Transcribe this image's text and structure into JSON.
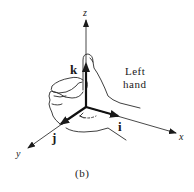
{
  "figure": {
    "caption": "(b)",
    "hand_label_line1": "Left",
    "hand_label_line2": "hand",
    "axes": {
      "x": "x",
      "y": "y",
      "z": "z"
    },
    "unit_vectors": {
      "i": "i",
      "j": "j",
      "k": "k"
    },
    "colors": {
      "ink": "#1a1a1a",
      "background": "#ffffff"
    }
  }
}
